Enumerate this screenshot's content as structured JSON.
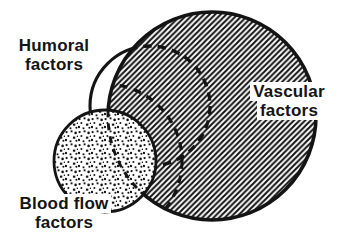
{
  "diagram": {
    "type": "venn-overlap-diagram",
    "background_color": "#ffffff",
    "ink_color": "#141414",
    "circles": [
      {
        "id": "vascular",
        "label_line1": "Vascular",
        "label_line2": "factors",
        "fill_pattern": "diagonal-hatch",
        "outline_style": "solid, dashed where hidden behind blood-flow circle",
        "relative_size": "large"
      },
      {
        "id": "humoral",
        "label_line1": "Humoral",
        "label_line2": "factors",
        "fill_pattern": "none",
        "outline_style": "solid outside vascular circle, dashed inside it",
        "relative_size": "medium"
      },
      {
        "id": "blood-flow",
        "label_line1": "Blood flow",
        "label_line2": "factors",
        "fill_pattern": "stipple-dots",
        "outline_style": "solid",
        "relative_size": "small"
      }
    ]
  }
}
